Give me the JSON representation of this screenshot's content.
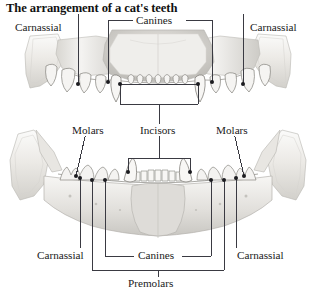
{
  "figure": {
    "title": "The arrangement of a cat's teeth",
    "background_color": "#ffffff",
    "line_color": "#3a3a42",
    "text_color": "#1a1a1a",
    "bone_fill": "#f0efec",
    "bone_shade": "#cfcdc8",
    "width": 316,
    "height": 297
  },
  "panels": [
    {
      "name": "upper-jaw",
      "description": "maxilla / upper jaw viewed from below"
    },
    {
      "name": "lower-jaw",
      "description": "mandible / lower jaw viewed from above"
    }
  ],
  "labels": [
    {
      "id": "carnassial-upper-left",
      "text": "Carnassial",
      "x": 13,
      "y": 22,
      "anchor": "start"
    },
    {
      "id": "canines-upper",
      "text": "Canines",
      "x": 137,
      "y": 22,
      "anchor": "start"
    },
    {
      "id": "carnassial-upper-right",
      "text": "Carnassial",
      "x": 249,
      "y": 22,
      "anchor": "start"
    },
    {
      "id": "molars-left",
      "text": "Molars",
      "x": 70,
      "y": 130,
      "anchor": "start"
    },
    {
      "id": "incisors",
      "text": "Incisors",
      "x": 141,
      "y": 130,
      "anchor": "start"
    },
    {
      "id": "molars-right",
      "text": "Molars",
      "x": 215,
      "y": 130,
      "anchor": "start"
    },
    {
      "id": "carnassial-lower-left",
      "text": "Carnassial",
      "x": 36,
      "y": 254,
      "anchor": "start"
    },
    {
      "id": "canines-lower",
      "text": "Canines",
      "x": 139,
      "y": 254,
      "anchor": "start"
    },
    {
      "id": "carnassial-lower-right",
      "text": "Carnassial",
      "x": 236,
      "y": 254,
      "anchor": "start"
    },
    {
      "id": "premolars",
      "text": "Premolars",
      "x": 152,
      "y": 281,
      "anchor": "middle"
    }
  ],
  "tooth_groups": [
    {
      "name": "incisors",
      "jaw": "both",
      "count_upper": 6,
      "count_lower": 6
    },
    {
      "name": "canines",
      "jaw": "both",
      "count_upper": 2,
      "count_lower": 2
    },
    {
      "name": "premolars",
      "jaw": "lower",
      "count_lower": 6
    },
    {
      "name": "molars",
      "jaw": "lower",
      "count_lower": 2
    },
    {
      "name": "carnassial",
      "jaw": "both",
      "count_upper": 2,
      "count_lower": 2
    }
  ]
}
